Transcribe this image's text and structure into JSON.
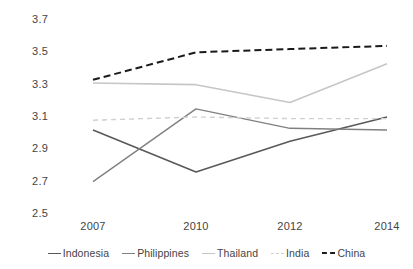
{
  "chart_data": {
    "type": "line",
    "title": "",
    "subtitle": "",
    "xlabel": "",
    "ylabel": "",
    "categories": [
      "2007",
      "2010",
      "2012",
      "2014"
    ],
    "category_positions": [
      93,
      196,
      290,
      387
    ],
    "ylim": [
      2.5,
      3.7
    ],
    "yticks": [
      3.7,
      3.5,
      3.3,
      3.1,
      2.9,
      2.7,
      2.5
    ],
    "ytick_labels": [
      "3.7",
      "3.5",
      "3.3",
      "3.1",
      "2.9",
      "2.7",
      "2.5"
    ],
    "grid": false,
    "legend_position": "bottom",
    "series": [
      {
        "name": "Indonesia",
        "values": [
          3.02,
          2.76,
          2.95,
          3.1
        ],
        "color": "#595959",
        "style": "solid",
        "width": 1.6
      },
      {
        "name": "Philippines",
        "values": [
          2.7,
          3.15,
          3.03,
          3.02
        ],
        "color": "#808080",
        "style": "solid",
        "width": 1.4
      },
      {
        "name": "Thailand",
        "values": [
          3.31,
          3.3,
          3.19,
          3.43
        ],
        "color": "#c6c6c6",
        "style": "solid",
        "width": 1.6
      },
      {
        "name": "India",
        "values": [
          3.08,
          3.1,
          3.09,
          3.09
        ],
        "color": "#d0d0d0",
        "style": "dashed",
        "width": 1.4
      },
      {
        "name": "China",
        "values": [
          3.33,
          3.5,
          3.52,
          3.54
        ],
        "color": "#1a1a1a",
        "style": "dashed",
        "width": 2.0
      }
    ]
  },
  "axis": {
    "y_labels": [
      "3.7",
      "3.5",
      "3.3",
      "3.1",
      "2.9",
      "2.7",
      "2.5"
    ],
    "x_labels": [
      "2007",
      "2010",
      "2012",
      "2014"
    ]
  },
  "legend": {
    "items": [
      {
        "label": "Indonesia",
        "color": "#595959",
        "style": "solid"
      },
      {
        "label": "Philippines",
        "color": "#808080",
        "style": "solid"
      },
      {
        "label": "Thailand",
        "color": "#c6c6c6",
        "style": "solid"
      },
      {
        "label": "India",
        "color": "#d0d0d0",
        "style": "dashed"
      },
      {
        "label": "China",
        "color": "#1a1a1a",
        "style": "dashed"
      }
    ]
  }
}
